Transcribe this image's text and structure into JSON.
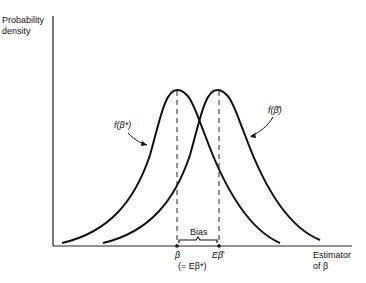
{
  "axes": {
    "y_label_line1": "Probability",
    "y_label_line2": "density",
    "x_label_line1": "Estimator",
    "x_label_line2": "of β"
  },
  "curves": [
    {
      "name": "f(β*)",
      "label": "f(β*)",
      "peak_x": "β"
    },
    {
      "name": "f(β̂)",
      "label": "f(β̂)",
      "peak_x": "Eβ̂"
    }
  ],
  "annotations": {
    "bias": "Bias",
    "beta": "β",
    "beta_eq": "(= Eβ*)",
    "e_beta_hat": "Eβ̂"
  },
  "colors": {
    "line": "#111111",
    "background": "#ffffff"
  }
}
